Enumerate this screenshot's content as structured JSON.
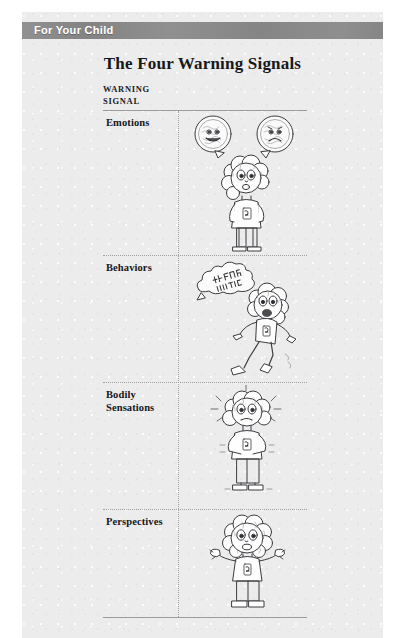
{
  "banner": {
    "label": "For Your Child"
  },
  "page": {
    "title": "The Four Warning Signals"
  },
  "table": {
    "column_header_line1": "WARNING",
    "column_header_line2": "SIGNAL",
    "rows": [
      {
        "label": "Emotions",
        "label_line1": "Emotions",
        "label_line2": "",
        "illustration": "child-with-two-thought-bubbles-happy-and-worried-brain-faces"
      },
      {
        "label": "Behaviors",
        "label_line1": "Behaviors",
        "label_line2": "",
        "illustration": "child-running-away-shouting-in-speech-cloud"
      },
      {
        "label": "Bodily Sensations",
        "label_line1": "Bodily",
        "label_line2": "Sensations",
        "illustration": "child-with-shaking-body-and-motion-lines"
      },
      {
        "label": "Perspectives",
        "label_line1": "Perspectives",
        "label_line2": "",
        "illustration": "child-shrugging-with-both-hands-raised"
      }
    ]
  },
  "colors": {
    "banner_background": "#8a8a8a",
    "banner_text": "#ffffff",
    "page_background": "#ececed",
    "text": "#16171a",
    "rule": "#9b9b9e"
  }
}
